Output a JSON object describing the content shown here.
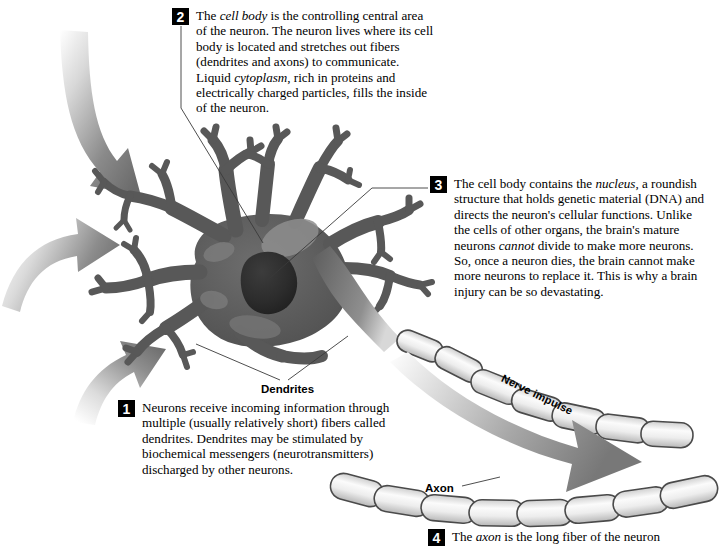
{
  "figure": {
    "background_color": "#ffffff"
  },
  "callouts": [
    {
      "number": "1",
      "text": "Neurons receive incoming information through multiple (usually relatively short) fibers called dendrites. Dendrites may be stimulated by biochemical messengers (neurotransmitters) discharged by other neurons."
    },
    {
      "number": "2",
      "text": "The cell body is the controlling central area of the neuron. The neuron lives where its cell body is located and stretches out fibers (dendrites and axons) to communicate. Liquid cytoplasm, rich in proteins and electrically charged particles, fills the inside of the neuron."
    },
    {
      "number": "3",
      "text": "The cell body contains the nucleus, a roundish structure that holds genetic material (DNA) and directs the neuron's cellular functions. Unlike the cells of other organs, the brain's mature neurons cannot divide to make more neurons. So, once a neuron dies, the brain cannot make more neurons to replace it. This is why a brain injury can be so devastating."
    },
    {
      "number": "4",
      "text": "The axon is the long fiber of the neuron"
    }
  ],
  "labels": {
    "dendrites": "Dendrites",
    "axon": "Axon",
    "nerve_impulse": "Nerve impulse"
  },
  "colors": {
    "neuron_body": "#585858",
    "cell_body_highlight": "#8c8c8c",
    "nucleus": "#2e2e2e",
    "myelin_light": "#f2f2f2",
    "myelin_outline": "#4a4a4a",
    "arrow_dark": "#6e6e6e",
    "leader_line": "#3a3a3a",
    "callout_number_bg": "#000000",
    "callout_number_fg": "#ffffff",
    "text": "#000000"
  }
}
